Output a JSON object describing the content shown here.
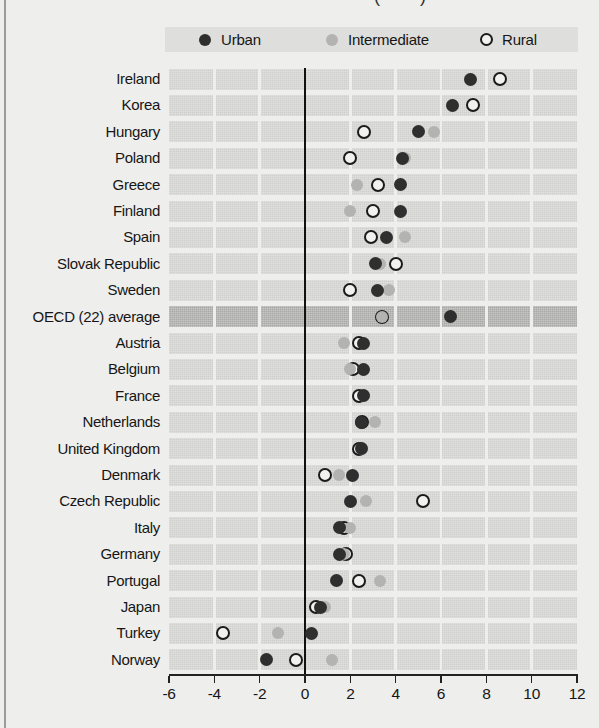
{
  "page": {
    "title_fragment": "(        )"
  },
  "legend": {
    "items": [
      {
        "id": "urban",
        "label": "Urban"
      },
      {
        "id": "intermediate",
        "label": "Intermediate"
      },
      {
        "id": "rural",
        "label": "Rural"
      }
    ]
  },
  "colors": {
    "background": "#eeeeec",
    "band": "#d0d0ce",
    "band_highlight": "#a9a9a7",
    "legend_bg": "#dededc",
    "urban": "#2f2f2f",
    "intermediate": "#b3b3b1",
    "rural_ring": "#1b1b1b",
    "rural_fill": "#f1f1ef",
    "zero_line": "#111111",
    "axis": "#222222"
  },
  "chart_data": {
    "type": "scatter",
    "subtype": "horizontal-dot-plot",
    "xlim": [
      -6,
      12
    ],
    "xticks": [
      -6,
      -4,
      -2,
      0,
      2,
      4,
      6,
      8,
      10,
      12
    ],
    "gridlines_at": [
      -4,
      -2,
      0,
      2,
      4,
      6,
      8,
      10
    ],
    "zero_line": 0,
    "legend_position": "top",
    "series_names": [
      "Urban",
      "Intermediate",
      "Rural"
    ],
    "draw_order": [
      "rural",
      "intermediate",
      "urban"
    ],
    "rows": [
      {
        "label": "Ireland",
        "urban": 7.3,
        "intermediate": 7.3,
        "rural": 8.6,
        "highlight": false
      },
      {
        "label": "Korea",
        "urban": 6.5,
        "intermediate": 6.5,
        "rural": 7.4,
        "highlight": false
      },
      {
        "label": "Hungary",
        "urban": 5.0,
        "intermediate": 5.7,
        "rural": 2.6,
        "highlight": false
      },
      {
        "label": "Poland",
        "urban": 4.3,
        "intermediate": 4.4,
        "rural": 2.0,
        "highlight": false
      },
      {
        "label": "Greece",
        "urban": 4.2,
        "intermediate": 2.3,
        "rural": 3.2,
        "highlight": false
      },
      {
        "label": "Finland",
        "urban": 4.2,
        "intermediate": 2.0,
        "rural": 3.0,
        "highlight": false
      },
      {
        "label": "Spain",
        "urban": 3.6,
        "intermediate": 4.4,
        "rural": 2.9,
        "highlight": false
      },
      {
        "label": "Slovak Republic",
        "urban": 3.1,
        "intermediate": 3.3,
        "rural": 4.0,
        "highlight": false
      },
      {
        "label": "Sweden",
        "urban": 3.2,
        "intermediate": 3.7,
        "rural": 2.0,
        "highlight": false
      },
      {
        "label": "OECD (22) average",
        "urban": 6.4,
        "intermediate": 3.4,
        "rural": 3.4,
        "highlight": true
      },
      {
        "label": "Austria",
        "urban": 2.6,
        "intermediate": 1.7,
        "rural": 2.4,
        "highlight": false
      },
      {
        "label": "Belgium",
        "urban": 2.6,
        "intermediate": 2.0,
        "rural": 2.1,
        "highlight": false
      },
      {
        "label": "France",
        "urban": 2.6,
        "intermediate": 2.6,
        "rural": 2.4,
        "highlight": false
      },
      {
        "label": "Netherlands",
        "urban": 2.5,
        "intermediate": 3.1,
        "rural": 2.5,
        "highlight": false
      },
      {
        "label": "United Kingdom",
        "urban": 2.5,
        "intermediate": 2.5,
        "rural": 2.4,
        "highlight": false
      },
      {
        "label": "Denmark",
        "urban": 2.1,
        "intermediate": 1.5,
        "rural": 0.9,
        "highlight": false
      },
      {
        "label": "Czech Republic",
        "urban": 2.0,
        "intermediate": 2.7,
        "rural": 5.2,
        "highlight": false
      },
      {
        "label": "Italy",
        "urban": 1.5,
        "intermediate": 2.0,
        "rural": 1.7,
        "highlight": false
      },
      {
        "label": "Germany",
        "urban": 1.5,
        "intermediate": 1.7,
        "rural": 1.8,
        "highlight": false
      },
      {
        "label": "Portugal",
        "urban": 1.4,
        "intermediate": 3.3,
        "rural": 2.4,
        "highlight": false
      },
      {
        "label": "Japan",
        "urban": 0.7,
        "intermediate": 0.9,
        "rural": 0.5,
        "highlight": false
      },
      {
        "label": "Turkey",
        "urban": 0.3,
        "intermediate": -1.2,
        "rural": -3.6,
        "highlight": false
      },
      {
        "label": "Norway",
        "urban": -1.7,
        "intermediate": 1.2,
        "rural": -0.4,
        "highlight": false
      }
    ]
  },
  "axis": {
    "tick_labels": [
      "-6",
      "-4",
      "-2",
      "0",
      "2",
      "4",
      "6",
      "8",
      "10",
      "12"
    ]
  }
}
